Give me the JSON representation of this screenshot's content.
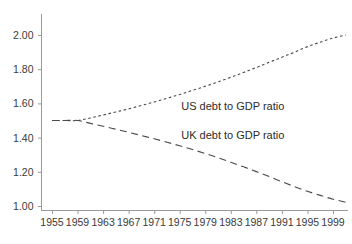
{
  "chart_data": {
    "type": "line",
    "title": "",
    "subtitle": "",
    "xlabel": "",
    "ylabel": "",
    "xlim": [
      1954,
      2002
    ],
    "ylim": [
      0.95,
      2.08
    ],
    "grid": false,
    "legend_position": "inline-annotation",
    "x_tick_labels": [
      "1955",
      "1959",
      "1963",
      "1967",
      "1971",
      "1975",
      "1979",
      "1983",
      "1987",
      "1991",
      "1995",
      "1999"
    ],
    "x_tick_values": [
      1955,
      1959,
      1963,
      1967,
      1971,
      1975,
      1979,
      1983,
      1987,
      1991,
      1995,
      1999
    ],
    "y_tick_labels": [
      "1.00",
      "1.20",
      "1.40",
      "1.60",
      "1.80",
      "2.00"
    ],
    "y_tick_values": [
      1.0,
      1.2,
      1.4,
      1.6,
      1.8,
      2.0
    ],
    "series": [
      {
        "name": "US debt to GDP ratio",
        "style": "dotted",
        "color": "#4a4a4a",
        "annotation": "US debt to GDP ratio",
        "x": [
          1955,
          1957,
          1959,
          1961,
          1963,
          1965,
          1967,
          1969,
          1971,
          1973,
          1975,
          1977,
          1979,
          1981,
          1983,
          1985,
          1987,
          1989,
          1991,
          1993,
          1995,
          1997,
          1999,
          2001
        ],
        "values": [
          1.5,
          1.5,
          1.5,
          1.515,
          1.532,
          1.55,
          1.568,
          1.588,
          1.608,
          1.63,
          1.652,
          1.676,
          1.7,
          1.726,
          1.753,
          1.781,
          1.81,
          1.84,
          1.87,
          1.9,
          1.932,
          1.958,
          1.982,
          2.0
        ]
      },
      {
        "name": "UK debt to GDP ratio",
        "style": "dashed",
        "color": "#4a4a4a",
        "annotation": "UK debt to GDP ratio",
        "x": [
          1955,
          1957,
          1959,
          1961,
          1963,
          1965,
          1967,
          1969,
          1971,
          1973,
          1975,
          1977,
          1979,
          1981,
          1983,
          1985,
          1987,
          1989,
          1991,
          1993,
          1995,
          1997,
          1999,
          2001
        ],
        "values": [
          1.5,
          1.5,
          1.5,
          1.483,
          1.466,
          1.449,
          1.431,
          1.412,
          1.393,
          1.373,
          1.352,
          1.33,
          1.307,
          1.282,
          1.256,
          1.229,
          1.201,
          1.172,
          1.142,
          1.113,
          1.086,
          1.062,
          1.04,
          1.022
        ]
      }
    ],
    "annotations": [
      {
        "text": "US debt to GDP ratio",
        "x": 1984,
        "y": 1.58
      },
      {
        "text": "UK debt to GDP ratio",
        "x": 1984,
        "y": 1.41
      }
    ]
  }
}
